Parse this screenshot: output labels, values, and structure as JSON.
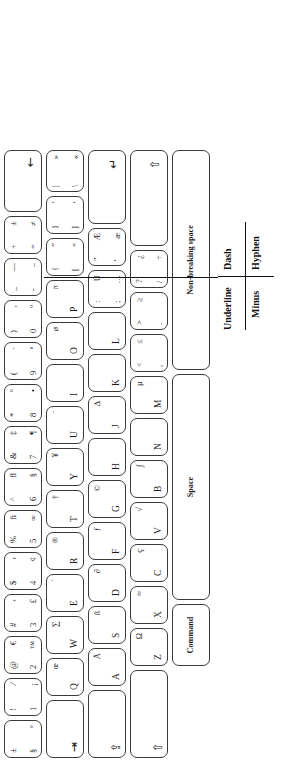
{
  "diagram": {
    "orientation": "rotated-90-ccw",
    "ink_color": "#3a3a3a",
    "text_color": "#1a1a1a",
    "background": "#ffffff"
  },
  "annotation": {
    "underline": "Underline",
    "dash": "Dash",
    "minus": "Minus",
    "hyphen": "Hyphen"
  },
  "rows": {
    "number_row": [
      {
        "name": "section",
        "tl": "±",
        "bl": "§",
        "tr": "",
        "br": "°"
      },
      {
        "name": "1",
        "tl": "!",
        "bl": "1",
        "tr": "⁄",
        "br": "¡"
      },
      {
        "name": "2",
        "tl": "@",
        "bl": "2",
        "tr": "€",
        "br": "™"
      },
      {
        "name": "3",
        "tl": "#",
        "bl": "3",
        "tr": "‹",
        "br": "£"
      },
      {
        "name": "4",
        "tl": "$",
        "bl": "4",
        "tr": "›",
        "br": "¢"
      },
      {
        "name": "5",
        "tl": "%",
        "bl": "5",
        "tr": "ﬁ",
        "br": "∞"
      },
      {
        "name": "6",
        "tl": "^",
        "bl": "6",
        "tr": "ﬂ",
        "br": "§"
      },
      {
        "name": "7",
        "tl": "&",
        "bl": "7",
        "tr": "‡",
        "br": "¶"
      },
      {
        "name": "8",
        "tl": "*",
        "bl": "8",
        "tr": "°",
        "br": "•"
      },
      {
        "name": "9",
        "tl": "(",
        "bl": "9",
        "tr": "·",
        "br": "ª"
      },
      {
        "name": "0",
        "tl": ")",
        "bl": "0",
        "tr": "‚",
        "br": "º"
      },
      {
        "name": "hyphen",
        "tl": "_",
        "bl": "-",
        "tr": "—",
        "br": "–"
      },
      {
        "name": "equals",
        "tl": "+",
        "bl": "=",
        "tr": "±",
        "br": "≠"
      },
      {
        "name": "delete",
        "symbol": "←"
      }
    ],
    "top_row": [
      {
        "name": "tab",
        "symbol": "⇥"
      },
      {
        "name": "Q",
        "letter": "Q",
        "alt": "œ"
      },
      {
        "name": "W",
        "letter": "W",
        "alt": "∑"
      },
      {
        "name": "E",
        "letter": "E",
        "alt": "´"
      },
      {
        "name": "R",
        "letter": "R",
        "alt": "®"
      },
      {
        "name": "T",
        "letter": "T",
        "alt": "†"
      },
      {
        "name": "Y",
        "letter": "Y",
        "alt": "¥"
      },
      {
        "name": "U",
        "letter": "U",
        "alt": "¨"
      },
      {
        "name": "I",
        "letter": "I",
        "alt": ""
      },
      {
        "name": "O",
        "letter": "O",
        "alt": "ø"
      },
      {
        "name": "P",
        "letter": "P",
        "alt": "π"
      },
      {
        "name": "bracket_left",
        "tl": "{",
        "bl": "[",
        "tr": "”",
        "br": "“"
      },
      {
        "name": "bracket_right",
        "tl": "}",
        "bl": "]",
        "tr": "’",
        "br": "‘"
      },
      {
        "name": "backslash",
        "tl": "|",
        "bl": "\\",
        "tr": "»",
        "br": "«"
      }
    ],
    "home_row": [
      {
        "name": "capslock",
        "symbol": "⇪"
      },
      {
        "name": "A",
        "letter": "A",
        "alt": "Å"
      },
      {
        "name": "S",
        "letter": "S",
        "alt": "ß"
      },
      {
        "name": "D",
        "letter": "D",
        "alt": "∂"
      },
      {
        "name": "F",
        "letter": "F",
        "alt": "ƒ"
      },
      {
        "name": "G",
        "letter": "G",
        "alt": "©"
      },
      {
        "name": "H",
        "letter": "H",
        "alt": ""
      },
      {
        "name": "J",
        "letter": "J",
        "alt": "∆"
      },
      {
        "name": "K",
        "letter": "K",
        "alt": ""
      },
      {
        "name": "L",
        "letter": "L",
        "alt": ""
      },
      {
        "name": "semicolon",
        "tl": ":",
        "bl": ";",
        "tr": "Ú",
        "br": "…"
      },
      {
        "name": "quote",
        "tl": "\"",
        "bl": "'",
        "tr": "Æ",
        "br": "æ"
      },
      {
        "name": "return",
        "symbol": "↵"
      }
    ],
    "bottom_row": [
      {
        "name": "shift_left",
        "symbol": "⇧"
      },
      {
        "name": "Z",
        "letter": "Z",
        "alt": "Ω"
      },
      {
        "name": "X",
        "letter": "X",
        "alt": "≈"
      },
      {
        "name": "C",
        "letter": "C",
        "alt": "ç"
      },
      {
        "name": "V",
        "letter": "V",
        "alt": "√"
      },
      {
        "name": "B",
        "letter": "B",
        "alt": "∫"
      },
      {
        "name": "N",
        "letter": "N",
        "alt": ""
      },
      {
        "name": "M",
        "letter": "M",
        "alt": "µ"
      },
      {
        "name": "comma",
        "tl": "<",
        "bl": ",",
        "tr": "≤",
        "br": "≤"
      },
      {
        "name": "period",
        "tl": ">",
        "bl": ".",
        "tr": "≥",
        "br": "≥"
      },
      {
        "name": "slash",
        "tl": "?",
        "bl": "/",
        "tr": "¿",
        "br": "÷"
      },
      {
        "name": "shift_right",
        "symbol": "⇧"
      }
    ],
    "space_row": [
      {
        "name": "command_left",
        "label": "Command"
      },
      {
        "name": "space",
        "label": "Space"
      },
      {
        "name": "command_right",
        "label": "Non-breaking space"
      }
    ]
  }
}
